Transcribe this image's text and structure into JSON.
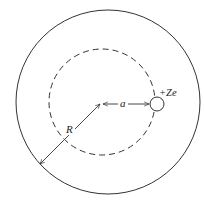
{
  "diagram": {
    "labels": {
      "radius_outer": "R",
      "radius_orbit": "a",
      "charge": "+Ze"
    },
    "colors": {
      "stroke": "#333333",
      "background": "#ffffff"
    }
  }
}
